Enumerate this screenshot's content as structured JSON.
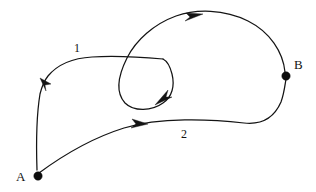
{
  "figure": {
    "type": "directed-graph-diagram",
    "background_color": "#ffffff",
    "stroke_color": "#141414",
    "width": 316,
    "height": 192
  },
  "nodes": [
    {
      "id": "A",
      "label": "A",
      "x": 38,
      "y": 176,
      "radius": 4.2,
      "label_x": 16,
      "label_y": 170
    },
    {
      "id": "B",
      "label": "B",
      "x": 286,
      "y": 76,
      "radius": 4.2,
      "label_x": 294,
      "label_y": 58
    }
  ],
  "edges": [
    {
      "id": "edge-1",
      "label": "1",
      "label_x": 74,
      "label_y": 42,
      "from": "loop",
      "to": "A",
      "direction": "up-left",
      "arrow_x": 43,
      "arrow_y": 82
    },
    {
      "id": "edge-2",
      "label": "2",
      "label_x": 181,
      "label_y": 128,
      "from": "A",
      "to": "B",
      "direction": "right",
      "arrow_x": 140,
      "arrow_y": 124
    },
    {
      "id": "edge-top-loop",
      "label": "",
      "from": "B",
      "to": "loop-center",
      "direction": "right-then-inward",
      "arrow_x": 195,
      "arrow_y": 15,
      "arrow_x2": 162,
      "arrow_y2": 101
    }
  ],
  "labels": {
    "node_a": "A",
    "node_b": "B",
    "edge_one": "1",
    "edge_two": "2"
  }
}
